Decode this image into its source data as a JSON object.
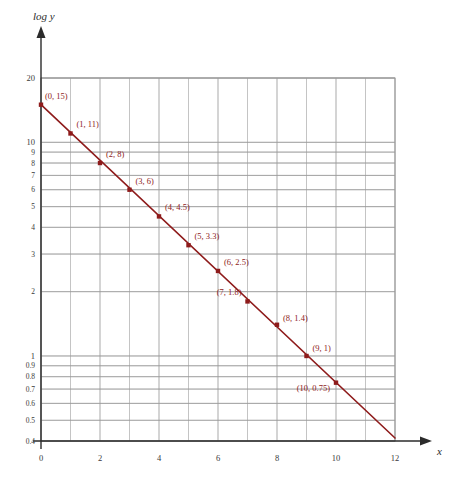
{
  "chart_data": {
    "type": "scatter",
    "title": "",
    "xlabel": "x",
    "ylabel": "log y",
    "yscale": "log",
    "grid": true,
    "legend": null,
    "xlim": [
      0,
      12
    ],
    "ylim": [
      0.4,
      20
    ],
    "x_ticks": [
      "0",
      "2",
      "4",
      "6",
      "8",
      "10",
      "12"
    ],
    "x_tick_values": [
      0,
      2,
      4,
      6,
      8,
      10,
      12
    ],
    "y_ticks": [
      "20",
      "10",
      "9",
      "8",
      "7",
      "6",
      "5",
      "4",
      "3",
      "2",
      "1",
      "0.9",
      "0.8",
      "0.7",
      "0.6",
      "0.5",
      "0.4"
    ],
    "y_tick_values": [
      20,
      10,
      9,
      8,
      7,
      6,
      5,
      4,
      3,
      2,
      1,
      0.9,
      0.8,
      0.7,
      0.6,
      0.5,
      0.4
    ],
    "origin_label": "0",
    "x": [
      0,
      1,
      2,
      3,
      4,
      5,
      6,
      7,
      8,
      9,
      10
    ],
    "values": [
      15,
      11,
      8,
      6,
      4.5,
      3.3,
      2.5,
      1.8,
      1.4,
      1,
      0.75
    ],
    "point_labels": [
      "(0, 15)",
      "(1, 11)",
      "(2, 8)",
      "(3, 6)",
      "(4, 4.5)",
      "(5, 3.3)",
      "(6, 2.5)",
      "(7, 1.8)",
      "(8, 1.4)",
      "(9, 1)",
      "(10, 0.75)"
    ],
    "series_color": "#8e1b1b",
    "grid_color": "#9a9a9a",
    "axis_color": "#2b2b2b",
    "line_extends_to_x": 12
  }
}
